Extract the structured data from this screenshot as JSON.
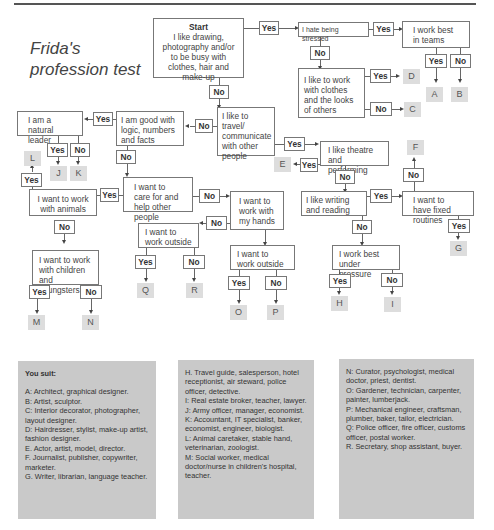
{
  "title_line1": "Frida's",
  "title_line2": "profession test",
  "labels": {
    "yes": "Yes",
    "no": "No"
  },
  "questions": {
    "start_heading": "Start",
    "start": "I like drawing, photography and/or to be busy with clothes, hair and make-up",
    "stressed": "I hate being stressed",
    "teams": "I work best in teams",
    "clothes": "I like to work with clothes and the looks of others",
    "travel": "I like to travel/ communicate with other people",
    "logic": "I am good with logic, numbers and facts",
    "leader": "I am a natural leader",
    "theatre": "I like theatre and performing",
    "care": "I want to care for and help other people",
    "hands": "I want to work with my hands",
    "animals": "I want to work with animals",
    "outside_left": "I want to work outside",
    "outside_mid": "I want to work outside",
    "writing": "I like writing and reading",
    "routines": "I want to have fixed routines",
    "pressure": "I work best under pressure",
    "children": "I want to work with children and youngsters"
  },
  "results": [
    "A",
    "B",
    "C",
    "D",
    "E",
    "F",
    "G",
    "H",
    "I",
    "J",
    "K",
    "L",
    "M",
    "N",
    "O",
    "P",
    "Q",
    "R"
  ],
  "legend": {
    "heading": "You suit:",
    "col1": [
      "A:  Architect, graphical designer.",
      "B:  Artist, sculptor.",
      "C:  Interior decorator, photographer, layout designer.",
      "D:  Hairdresser, stylist, make-up artist, fashion designer.",
      "E.  Actor, artist, model, director.",
      "F.  Journalist, publisher, copywriter, marketer.",
      "G.  Writer, librarian, language teacher."
    ],
    "col2": [
      "H.  Travel guide, salesperson, hotel receptionist, air steward, police officer, detective.",
      "I:  Real estate broker, teacher, lawyer.",
      "J:  Army officer, manager, economist.",
      "K:  Accountant, IT specialist, banker, economist, engineer, biologist.",
      "L:  Animal caretaker, stable hand, veterinarian, zoologist.",
      "M:  Social worker, medical doctor/nurse in children's hospital, teacher."
    ],
    "col3": [
      "N:  Curator, psychologist, medical doctor, priest, dentist.",
      "O:  Gardener, technician, carpenter, painter, lumberjack.",
      "P:  Mechanical engineer, craftsman, plumber, baker, tailor, electrician.",
      "Q:  Police officer, fire officer, customs officer, postal worker.",
      "R.  Secretary, shop assistant, buyer."
    ]
  }
}
